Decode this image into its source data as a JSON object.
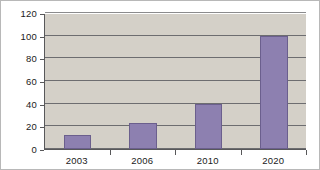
{
  "chart_data": {
    "type": "bar",
    "title": "",
    "subtitle": "",
    "xlabel": "",
    "ylabel": "",
    "categories": [
      "2003",
      "2006",
      "2010",
      "2020"
    ],
    "values": [
      12,
      23,
      40,
      100
    ],
    "series": [
      {
        "name": "",
        "values": [
          12,
          23,
          40,
          100
        ]
      }
    ],
    "ylim": [
      0,
      120
    ],
    "ytick_labels": [
      "0",
      "20",
      "40",
      "60",
      "80",
      "100",
      "120"
    ],
    "ytick_values": [
      0,
      20,
      40,
      60,
      80,
      100,
      120
    ],
    "xtick_labels": [
      "2003",
      "2006",
      "2010",
      "2020"
    ],
    "grid": true,
    "grid_axis": "y",
    "legend": false,
    "legend_position": "none",
    "annotations": []
  },
  "style": {
    "bar_color": "#8d80b0",
    "bar_border_color": "#6b5f8d",
    "plot_background": "#d4d0c8",
    "page_background": "#ffffff",
    "gridline_color": "#6d6d70",
    "axis_color": "#58585a",
    "text_color": "#1a1a1a",
    "frame_color": "#b8b8b8"
  }
}
